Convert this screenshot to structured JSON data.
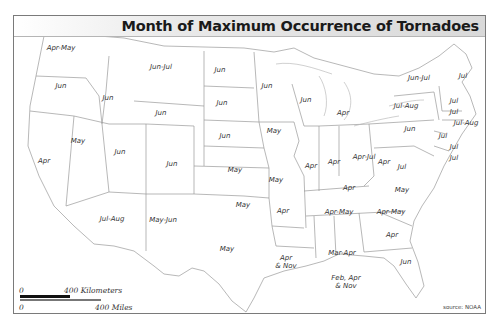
{
  "title": "Month of Maximum Occurrence of Tornadoes",
  "source": "source: NOAA",
  "scale": {
    "km_zero": "0",
    "km_label": "400 Kilometers",
    "mi_zero": "0",
    "mi_label": "400 Miles"
  },
  "colors": {
    "title_bar": "#d9d9d9",
    "border": "#7a7a7a",
    "state_lines": "#9a9a9a",
    "text": "#333333"
  },
  "states": [
    {
      "name": "Washington",
      "label": "Apr-May",
      "x": 47,
      "y": 32
    },
    {
      "name": "Oregon",
      "label": "Jun",
      "x": 47,
      "y": 70
    },
    {
      "name": "Idaho",
      "label": "Jun",
      "x": 94,
      "y": 82
    },
    {
      "name": "Montana",
      "label": "Jun-Jul",
      "x": 147,
      "y": 51
    },
    {
      "name": "Wyoming",
      "label": "Jun",
      "x": 147,
      "y": 97
    },
    {
      "name": "California",
      "label": "Apr",
      "x": 30,
      "y": 145
    },
    {
      "name": "Nevada",
      "label": "May",
      "x": 64,
      "y": 125
    },
    {
      "name": "Utah",
      "label": "Jun",
      "x": 106,
      "y": 136
    },
    {
      "name": "Colorado",
      "label": "Jun",
      "x": 158,
      "y": 148
    },
    {
      "name": "Arizona",
      "label": "Jul-Aug",
      "x": 98,
      "y": 203
    },
    {
      "name": "New Mexico",
      "label": "May-Jun",
      "x": 149,
      "y": 204
    },
    {
      "name": "North Dakota",
      "label": "Jun",
      "x": 206,
      "y": 54
    },
    {
      "name": "South Dakota",
      "label": "Jun",
      "x": 208,
      "y": 87
    },
    {
      "name": "Nebraska",
      "label": "Jun",
      "x": 211,
      "y": 120
    },
    {
      "name": "Kansas",
      "label": "May",
      "x": 221,
      "y": 154
    },
    {
      "name": "Oklahoma",
      "label": "May",
      "x": 229,
      "y": 189
    },
    {
      "name": "Texas",
      "label": "May",
      "x": 213,
      "y": 233
    },
    {
      "name": "Minnesota",
      "label": "Jun",
      "x": 253,
      "y": 70
    },
    {
      "name": "Iowa",
      "label": "May",
      "x": 260,
      "y": 115
    },
    {
      "name": "Missouri",
      "label": "May",
      "x": 262,
      "y": 164
    },
    {
      "name": "Arkansas",
      "label": "Apr",
      "x": 269,
      "y": 195
    },
    {
      "name": "Louisiana",
      "label": "Apr\n& Nov",
      "x": 272,
      "y": 246
    },
    {
      "name": "Wisconsin",
      "label": "Jun",
      "x": 292,
      "y": 84
    },
    {
      "name": "Illinois",
      "label": "Apr",
      "x": 297,
      "y": 150
    },
    {
      "name": "Michigan",
      "label": "Apr",
      "x": 329,
      "y": 97
    },
    {
      "name": "Indiana",
      "label": "Apr",
      "x": 320,
      "y": 146
    },
    {
      "name": "Ohio",
      "label": "Apr-Jul",
      "x": 350,
      "y": 141
    },
    {
      "name": "Kentucky",
      "label": "Apr",
      "x": 335,
      "y": 172
    },
    {
      "name": "Tennessee",
      "label": "Apr-May",
      "x": 325,
      "y": 196
    },
    {
      "name": "Mississippi",
      "label": "Apr",
      "x": 0,
      "y": 0,
      "hidden": true
    },
    {
      "name": "Alabama",
      "label": "Mar-Apr",
      "x": 328,
      "y": 237
    },
    {
      "name": "Georgia",
      "label": "Apr",
      "x": 378,
      "y": 219
    },
    {
      "name": "Gulf Coast",
      "label": "Feb, Apr\n& Nov",
      "x": 332,
      "y": 266
    },
    {
      "name": "Florida",
      "label": "Jun",
      "x": 392,
      "y": 246
    },
    {
      "name": "South Carolina",
      "label": "Apr-May",
      "x": 377,
      "y": 196
    },
    {
      "name": "North Carolina",
      "label": "May",
      "x": 388,
      "y": 174
    },
    {
      "name": "Virginia",
      "label": "Jul",
      "x": 388,
      "y": 151
    },
    {
      "name": "West Virginia",
      "label": "Apr",
      "x": 370,
      "y": 146
    },
    {
      "name": "Pennsylvania",
      "label": "Jun",
      "x": 396,
      "y": 113
    },
    {
      "name": "New York",
      "label": "Jul-Aug",
      "x": 392,
      "y": 90
    },
    {
      "name": "New Jersey",
      "label": "Jul",
      "x": 429,
      "y": 120
    },
    {
      "name": "Delaware",
      "label": "Jul",
      "x": 440,
      "y": 131
    },
    {
      "name": "Maryland",
      "label": "Jul",
      "x": 440,
      "y": 142
    },
    {
      "name": "Vermont/NH",
      "label": "Jun-Jul",
      "x": 405,
      "y": 62
    },
    {
      "name": "Maine",
      "label": "Jul",
      "x": 449,
      "y": 60
    },
    {
      "name": "New Hampshire",
      "label": "Jul",
      "x": 440,
      "y": 85
    },
    {
      "name": "Massachusetts",
      "label": "Jul",
      "x": 440,
      "y": 96
    },
    {
      "name": "Connecticut/RI",
      "label": "Jul-Aug",
      "x": 452,
      "y": 107
    }
  ]
}
